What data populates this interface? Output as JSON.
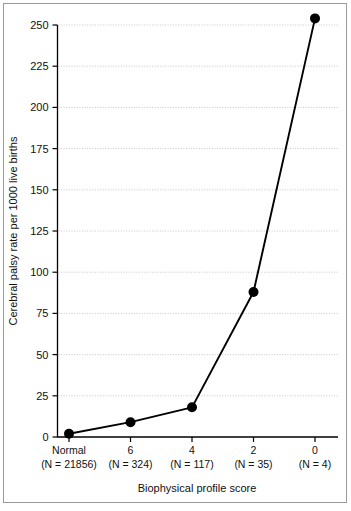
{
  "chart_data": {
    "type": "line",
    "title": "",
    "xlabel": "Biophysical profile score",
    "ylabel": "Cerebral palsy rate per 1000 live births",
    "categories": [
      "Normal",
      "6",
      "4",
      "2",
      "0"
    ],
    "category_sublabels": [
      "(N = 21856)",
      "(N = 324)",
      "(N = 117)",
      "(N = 35)",
      "(N = 4)"
    ],
    "group_sizes": [
      21856,
      324,
      117,
      35,
      4
    ],
    "values": [
      2,
      9,
      18,
      88,
      254
    ],
    "series": [
      {
        "name": "Cerebral palsy rate per 1000 live births",
        "values": [
          2,
          9,
          18,
          88,
          254
        ]
      }
    ],
    "ylim": [
      0,
      250
    ],
    "yticks": [
      0,
      25,
      50,
      75,
      100,
      125,
      150,
      175,
      200,
      225,
      250
    ],
    "ytick_labels": [
      "0",
      "25",
      "50",
      "75",
      "100",
      "125",
      "150",
      "175",
      "200",
      "225",
      "250"
    ],
    "grid": true,
    "grid_axis": "y",
    "legend": false,
    "legend_position": "none",
    "marker": "filled-circle",
    "line_color": "#000000",
    "marker_color": "#000000",
    "grid_color": "#b8b8b8",
    "background_color": "#ffffff"
  },
  "figure": {
    "border_color": "#9a9a9a"
  }
}
